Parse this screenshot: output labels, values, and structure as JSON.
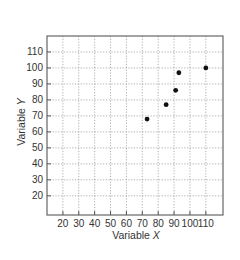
{
  "chart_data": {
    "type": "scatter",
    "title": "",
    "xlabel": "Variable X",
    "ylabel": "Variable Y",
    "xlabel_prefix": "Variable ",
    "xlabel_var": "X",
    "ylabel_prefix": "Variable ",
    "ylabel_var": "Y",
    "xlim": [
      10,
      120.8
    ],
    "ylim": [
      8,
      120
    ],
    "xticks": [
      20,
      30,
      40,
      50,
      60,
      70,
      80,
      90,
      100,
      110
    ],
    "yticks": [
      20,
      30,
      40,
      50,
      60,
      70,
      80,
      90,
      100,
      110
    ],
    "grid": true,
    "legend": null,
    "points": [
      {
        "x": 73,
        "y": 68
      },
      {
        "x": 85,
        "y": 77
      },
      {
        "x": 91,
        "y": 86
      },
      {
        "x": 93,
        "y": 97
      },
      {
        "x": 110,
        "y": 100
      }
    ],
    "colors": {
      "points": "#111111",
      "grid": "#9a9a9a",
      "frame": "#666666"
    }
  }
}
